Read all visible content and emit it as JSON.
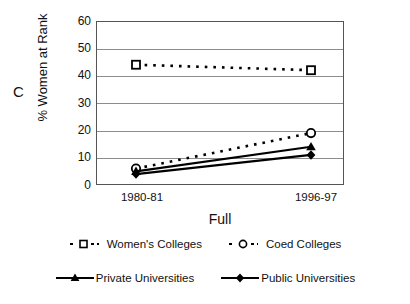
{
  "panel": {
    "letter": "C"
  },
  "axes": {
    "ylabel": "% Women at Rank",
    "xlabel": "Full",
    "yticks": [
      "60",
      "50",
      "40",
      "30",
      "20",
      "10",
      "0"
    ],
    "xticks": [
      "1980-81",
      "1996-97"
    ]
  },
  "legend": {
    "row1": [
      {
        "name": "womens-colleges",
        "label": "Women's Colleges",
        "marker": "open-square",
        "style": "dotted"
      },
      {
        "name": "coed-colleges",
        "label": "Coed Colleges",
        "marker": "open-circle",
        "style": "dotted"
      }
    ],
    "row2": [
      {
        "name": "private-universities",
        "label": "Private Universities",
        "marker": "filled-triangle",
        "style": "solid"
      },
      {
        "name": "public-universities",
        "label": "Public Universities",
        "marker": "filled-diamond",
        "style": "solid"
      }
    ]
  },
  "chart_data": {
    "type": "line",
    "title": "",
    "xlabel": "Full",
    "ylabel": "% Women at Rank",
    "categories": [
      "1980-81",
      "1996-97"
    ],
    "ylim": [
      0,
      60
    ],
    "ytick_step": 10,
    "grid": "horizontal",
    "legend_position": "bottom",
    "series": [
      {
        "name": "Women's Colleges",
        "values": [
          44,
          42
        ],
        "marker": "open-square",
        "linestyle": "dotted",
        "color": "#000000"
      },
      {
        "name": "Coed Colleges",
        "values": [
          6,
          19
        ],
        "marker": "open-circle",
        "linestyle": "dotted",
        "color": "#000000"
      },
      {
        "name": "Private Universities",
        "values": [
          5,
          14
        ],
        "marker": "filled-triangle",
        "linestyle": "solid",
        "color": "#000000"
      },
      {
        "name": "Public Universities",
        "values": [
          4,
          11
        ],
        "marker": "filled-diamond",
        "linestyle": "solid",
        "color": "#000000"
      }
    ]
  }
}
